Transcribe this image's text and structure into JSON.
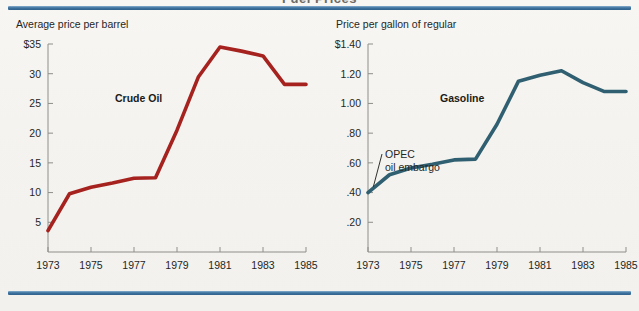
{
  "page": {
    "background_color": "#f3f2ee",
    "rule_color": "#3f74a0",
    "clipped_top_title": "Fuel Prices"
  },
  "chart_data": [
    {
      "type": "line",
      "id": "crude-oil",
      "title": "Crude Oil",
      "ylabel": "Average price per barrel",
      "xlabel": "",
      "series_color": "#a5221f",
      "grid": false,
      "legend_position": "inline-label",
      "ylim": [
        0,
        35
      ],
      "xlim": [
        1973,
        1985
      ],
      "ytick_labels": [
        "$35",
        "30",
        "25",
        "20",
        "15",
        "10",
        "5"
      ],
      "ytick_values": [
        35,
        30,
        25,
        20,
        15,
        10,
        5
      ],
      "xtick_labels": [
        "1973",
        "1975",
        "1977",
        "1979",
        "1981",
        "1983",
        "1985"
      ],
      "xtick_values": [
        1973,
        1975,
        1977,
        1979,
        1981,
        1983,
        1985
      ],
      "x": [
        1973,
        1974,
        1975,
        1976,
        1977,
        1978,
        1979,
        1980,
        1981,
        1982,
        1983,
        1984,
        1985
      ],
      "values": [
        3.6,
        9.8,
        10.9,
        11.6,
        12.4,
        12.5,
        20.5,
        29.5,
        34.5,
        33.8,
        33.0,
        28.2,
        28.2
      ],
      "annotations": []
    },
    {
      "type": "line",
      "id": "gasoline",
      "title": "Gasoline",
      "ylabel": "Price per gallon of regular",
      "xlabel": "",
      "series_color": "#2f5f71",
      "grid": false,
      "legend_position": "inline-label",
      "ylim": [
        0,
        1.4
      ],
      "xlim": [
        1973,
        1985
      ],
      "ytick_labels": [
        "$1.40",
        "1.20",
        "1.00",
        ".80",
        ".60",
        ".40",
        ".20"
      ],
      "ytick_values": [
        1.4,
        1.2,
        1.0,
        0.8,
        0.6,
        0.4,
        0.2
      ],
      "xtick_labels": [
        "1973",
        "1975",
        "1977",
        "1979",
        "1981",
        "1983",
        "1985"
      ],
      "xtick_values": [
        1973,
        1975,
        1977,
        1979,
        1981,
        1983,
        1985
      ],
      "x": [
        1973,
        1974,
        1975,
        1976,
        1977,
        1978,
        1979,
        1980,
        1981,
        1982,
        1983,
        1984,
        1985
      ],
      "values": [
        0.4,
        0.52,
        0.565,
        0.59,
        0.62,
        0.625,
        0.86,
        1.15,
        1.19,
        1.22,
        1.14,
        1.08,
        1.08
      ],
      "annotations": [
        {
          "text_line1": "OPEC",
          "text_line2": "oil embargo",
          "target_x": 1973.25,
          "target_y": 0.44
        }
      ]
    }
  ]
}
